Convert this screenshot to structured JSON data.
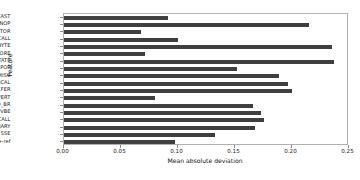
{
  "chart_data": {
    "type": "bar",
    "orientation": "horizontal",
    "title": "",
    "xlabel": "Mean absolute deviation",
    "ylabel": "Feature",
    "xlim": [
      0.0,
      0.25
    ],
    "ylim": null,
    "grid": false,
    "legend": null,
    "bar_color": "#3f3f3f",
    "xticks": [
      "0.00",
      "0.05",
      "0.10",
      "0.15",
      "0.20",
      "0.25"
    ],
    "xtick_values": [
      0.0,
      0.05,
      0.1,
      0.15,
      0.2,
      0.25
    ],
    "categories": [
      "BROADCAST",
      "NOP",
      "XRSTOR",
      "SYSCALL",
      "BITBYTE",
      "SEMAPHORE",
      "ROTATE",
      "POP",
      "MISC",
      "LOGICAL",
      "DATAXFER",
      "CONVERT",
      "COND_BR",
      "CMOVBE",
      "CALL",
      "BINARY",
      "SSE",
      "cache-ref"
    ],
    "values": [
      0.0915,
      0.215,
      0.068,
      0.1,
      0.2355,
      0.0715,
      0.237,
      0.1525,
      0.189,
      0.1965,
      0.2,
      0.08,
      0.1665,
      0.173,
      0.176,
      0.168,
      0.1325,
      0.098
    ]
  },
  "axes": {
    "x_label": "Mean absolute deviation",
    "y_label": "Feature"
  }
}
